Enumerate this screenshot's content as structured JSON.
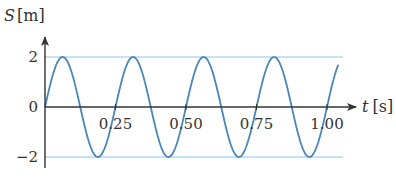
{
  "chart_data": {
    "type": "line",
    "title": "",
    "xlabel": "t [s]",
    "ylabel": "S [m]",
    "xlabel_parts": {
      "var": "t",
      "unit": "[s]"
    },
    "ylabel_parts": {
      "var": "S",
      "unit": "[m]"
    },
    "function": "S(t) = 2·sin(2π·t / 0.25)",
    "amplitude": 2,
    "period": 0.25,
    "xlim": [
      0,
      1.04
    ],
    "ylim": [
      -2,
      2
    ],
    "x_ticks": [
      0.25,
      0.5,
      0.75,
      1.0
    ],
    "x_tick_labels": [
      "0.25",
      "0.50",
      "0.75",
      "1.00"
    ],
    "y_ticks": [
      2,
      0,
      -2
    ],
    "y_tick_labels": [
      "2",
      "0",
      "−2"
    ],
    "reference_lines": [
      2,
      -2
    ],
    "grid": false,
    "legend": null,
    "series": [
      {
        "name": "S(t)",
        "x": [
          0,
          0.0625,
          0.125,
          0.1875,
          0.25,
          0.3125,
          0.375,
          0.4375,
          0.5,
          0.5625,
          0.625,
          0.6875,
          0.75,
          0.8125,
          0.875,
          0.9375,
          1.0,
          1.04
        ],
        "values": [
          0,
          2,
          0,
          -2,
          0,
          2,
          0,
          -2,
          0,
          2,
          0,
          -2,
          0,
          2,
          0,
          -2,
          0,
          1.81
        ]
      }
    ],
    "colors": {
      "curve": "#4a86b8",
      "reference_line": "#8cc4e8",
      "axis": "#333333",
      "text": "#333333"
    }
  }
}
